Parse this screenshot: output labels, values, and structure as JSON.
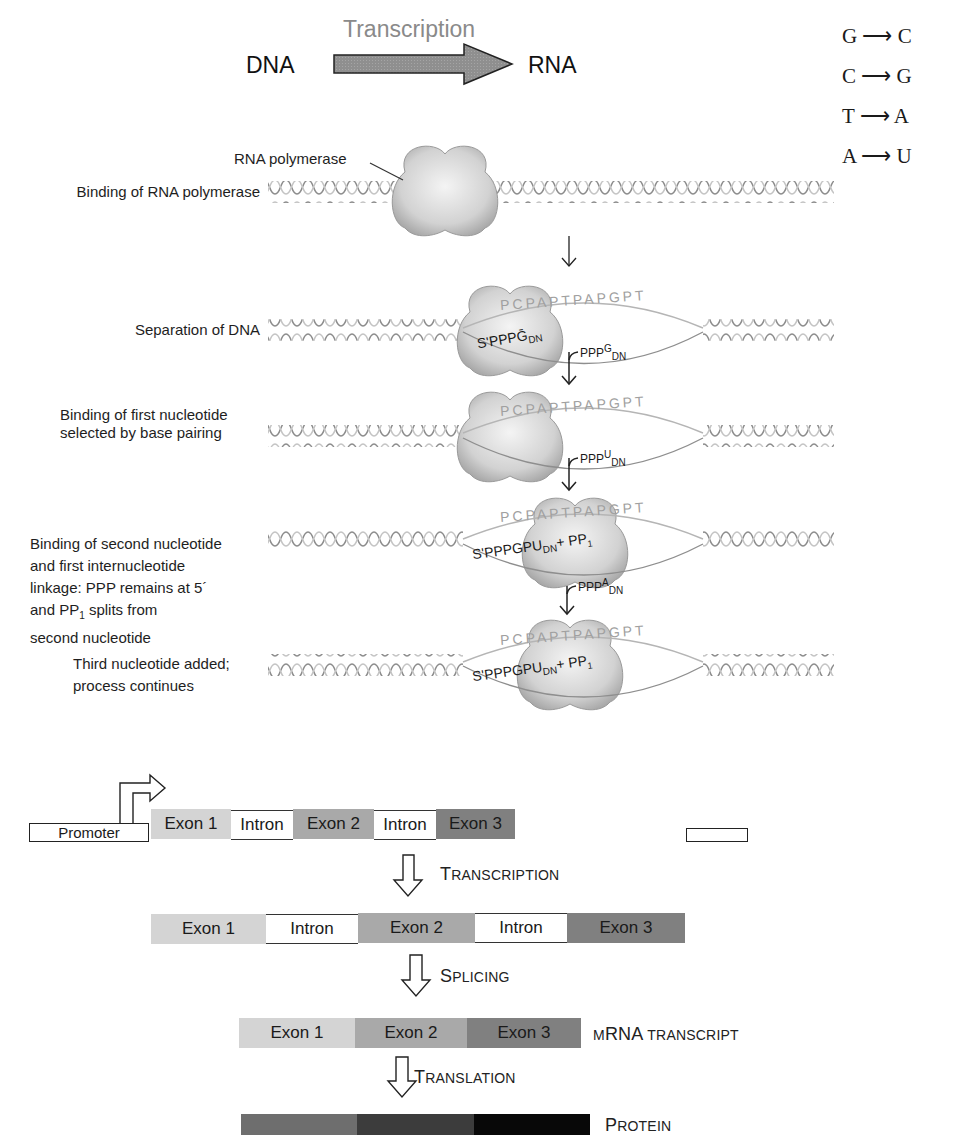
{
  "header": {
    "process_label": "Transcription",
    "from_label": "DNA",
    "to_label": "RNA"
  },
  "base_pairing": [
    {
      "dna": "G",
      "rna": "C"
    },
    {
      "dna": "C",
      "rna": "G"
    },
    {
      "dna": "T",
      "rna": "A"
    },
    {
      "dna": "A",
      "rna": "U"
    }
  ],
  "polymerase_label": "RNA polymerase",
  "steps": [
    {
      "label_lines": [
        "Binding of RNA polymerase"
      ]
    },
    {
      "label_lines": [
        "Separation of DNA"
      ],
      "template_strand": "PCPAPTPAPGPT",
      "rna_chain": "S'PPPḠDN"
    },
    {
      "label_lines": [
        "Binding of first nucleotide",
        "selected by base pairing"
      ],
      "template_strand": "PCPAPTPAPGPT"
    },
    {
      "label_lines": [
        "Binding of second nucleotide",
        "and first internucleotide",
        "linkage: PPP remains at 5´",
        "and PP1 splits from",
        "second nucleotide"
      ],
      "template_strand": "PCPAPTPAPGPT",
      "rna_chain": "S'PPPGPUDN+ PP1"
    },
    {
      "label_lines": [
        "Third nucleotide added;",
        "process continues"
      ],
      "template_strand": "PCPAPTPAPGPT",
      "rna_chain": "S'PPPGPUDN+ PP1"
    }
  ],
  "incoming_nucleotides": [
    {
      "prefix": "PPP",
      "base": "G",
      "sub": "DN"
    },
    {
      "prefix": "PPP",
      "base": "U",
      "sub": "DN"
    },
    {
      "prefix": "PPP",
      "base": "A",
      "sub": "DN"
    }
  ],
  "gene": {
    "promoter_label": "Promoter",
    "segments": [
      {
        "label": "Exon 1",
        "type": "exon",
        "color": "#d4d4d4"
      },
      {
        "label": "Intron",
        "type": "intron",
        "color": "#ffffff"
      },
      {
        "label": "Exon 2",
        "type": "exon",
        "color": "#a9a9a9"
      },
      {
        "label": "Intron",
        "type": "intron",
        "color": "#ffffff"
      },
      {
        "label": "Exon 3",
        "type": "exon",
        "color": "#808080"
      }
    ]
  },
  "flow": {
    "transcription": {
      "first": "T",
      "rest": "RANSCRIPTION"
    },
    "splicing": {
      "first": "S",
      "rest": "PLICING"
    },
    "translation": {
      "first": "T",
      "rest": "RANSLATION"
    }
  },
  "pre_mrna": {
    "segments": [
      "Exon 1",
      "Intron",
      "Exon 2",
      "Intron",
      "Exon 3"
    ]
  },
  "mrna": {
    "segments": [
      "Exon 1",
      "Exon 2",
      "Exon 3"
    ],
    "label_small1": "M",
    "label_main": "RNA",
    "label_small2": "TRANSCRIPT"
  },
  "protein": {
    "colors": [
      "#6e6e6e",
      "#3c3c3c",
      "#080808"
    ],
    "label_first": "P",
    "label_rest": "ROTEIN"
  },
  "colors": {
    "exon1": "#d4d4d4",
    "exon2": "#a9a9a9",
    "exon3": "#808080",
    "polymerase": "#d6d6d6",
    "helix_dark": "#8c8c8c",
    "helix_light": "#c4c4c4"
  }
}
